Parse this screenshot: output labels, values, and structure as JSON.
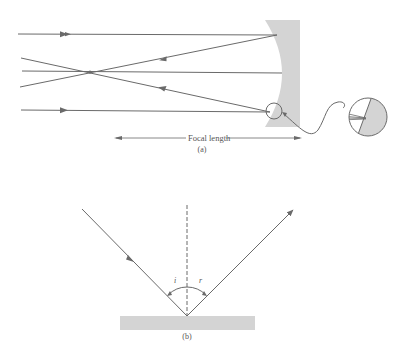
{
  "figure": {
    "part_a": {
      "caption": "(a)",
      "dimension_label": "Focal length",
      "mirror": "concave-mirror",
      "inset": "magnified-surface-detail"
    },
    "part_b": {
      "caption": "(b)",
      "angle_incidence_label": "i",
      "angle_reflection_label": "r",
      "surface": "flat-mirror"
    }
  },
  "colors": {
    "line": "#6a6a6a",
    "mirror_fill": "#d4d4d4",
    "background": "#ffffff"
  }
}
